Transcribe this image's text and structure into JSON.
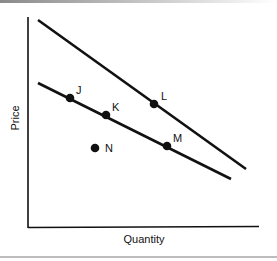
{
  "diagram": {
    "x_axis_label": "Quantity",
    "y_axis_label": "Price",
    "lines": [
      {
        "name": "upper-demand-curve",
        "from": [
          38,
          20
        ],
        "to": [
          246,
          169
        ]
      },
      {
        "name": "lower-demand-curve",
        "from": [
          38,
          83
        ],
        "to": [
          231,
          179
        ]
      }
    ],
    "points": [
      {
        "label": "J",
        "x": 70,
        "y": 98
      },
      {
        "label": "K",
        "x": 106,
        "y": 115
      },
      {
        "label": "L",
        "x": 154,
        "y": 104
      },
      {
        "label": "M",
        "x": 167,
        "y": 146
      },
      {
        "label": "N",
        "x": 95,
        "y": 148
      }
    ]
  }
}
